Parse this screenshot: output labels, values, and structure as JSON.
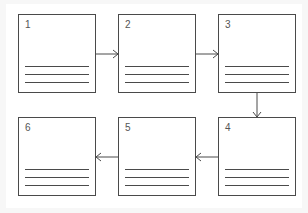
{
  "diagram": {
    "type": "flow",
    "layout": "snake 3x2",
    "steps": [
      {
        "label": "1",
        "row": 0,
        "col": 0
      },
      {
        "label": "2",
        "row": 0,
        "col": 1
      },
      {
        "label": "3",
        "row": 0,
        "col": 2
      },
      {
        "label": "4",
        "row": 1,
        "col": 2
      },
      {
        "label": "5",
        "row": 1,
        "col": 1
      },
      {
        "label": "6",
        "row": 1,
        "col": 0
      }
    ],
    "edges": [
      {
        "from": "1",
        "to": "2"
      },
      {
        "from": "2",
        "to": "3"
      },
      {
        "from": "3",
        "to": "4"
      },
      {
        "from": "4",
        "to": "5"
      },
      {
        "from": "5",
        "to": "6"
      }
    ],
    "lines_per_box": 3,
    "colors": {
      "stroke": "#4a4a4a",
      "background": "#ffffff",
      "page": "#f7f7f7"
    }
  }
}
